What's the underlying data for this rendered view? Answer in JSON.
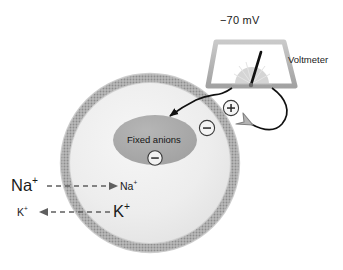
{
  "diagram": {
    "voltmeter": {
      "reading": "−70 mV",
      "label": "Voltmeter",
      "needle_name": "needle"
    },
    "cell": {
      "interior_label": "Fixed anions",
      "interior_charge": "−",
      "membrane_inner_charge": "−",
      "membrane_outer_charge": "+"
    },
    "ions": [
      {
        "name": "sodium",
        "outside_label": "Na",
        "outside_charge": "+",
        "inside_label": "Na",
        "inside_charge": "+",
        "direction": "inward",
        "outside_size": "large",
        "inside_size": "small"
      },
      {
        "name": "potassium",
        "outside_label": "K",
        "outside_charge": "+",
        "inside_label": "K",
        "inside_charge": "+",
        "direction": "outward",
        "outside_size": "small",
        "inside_size": "large"
      }
    ],
    "colors": {
      "background": "#ffffff",
      "membrane": "#9b9b9b",
      "membrane_light": "#c4c4c4",
      "cytoplasm": "#ededed",
      "anion_blob": "#a8a8a8",
      "meter_body": "#b0b0b0",
      "wire": "#111111",
      "text": "#1a1a1a",
      "dashed_arrow": "#6e6e6e",
      "hollow_arrow": "#9a9a9a"
    }
  }
}
